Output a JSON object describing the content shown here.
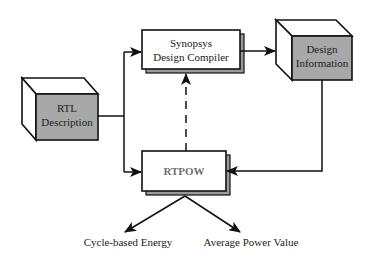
{
  "diagram": {
    "nodes": {
      "rtl": {
        "line1": "RTL",
        "line2": "Description",
        "shape": "3d-box",
        "fill": "#a8a8a8"
      },
      "compiler": {
        "line1": "Synopsys",
        "line2": "Design Compiler",
        "shape": "stacked-rect",
        "fill": "#ffffff"
      },
      "design_info": {
        "line1": "Design",
        "line2": "Information",
        "shape": "3d-box",
        "fill": "#a8a8a8"
      },
      "rtpow": {
        "label": "RTPOW",
        "shape": "stacked-rect",
        "fill": "#ffffff",
        "text_color": "#707070"
      }
    },
    "outputs": {
      "energy": "Cycle-based Energy",
      "power": "Average Power Value"
    },
    "edges": [
      {
        "from": "rtl",
        "to": "compiler",
        "style": "solid"
      },
      {
        "from": "rtl",
        "to": "rtpow",
        "style": "solid"
      },
      {
        "from": "compiler",
        "to": "design_info",
        "style": "solid"
      },
      {
        "from": "design_info",
        "to": "rtpow",
        "style": "solid"
      },
      {
        "from": "rtpow",
        "to": "compiler",
        "style": "dashed"
      },
      {
        "from": "rtpow",
        "to": "energy",
        "style": "solid"
      },
      {
        "from": "rtpow",
        "to": "power",
        "style": "solid"
      }
    ],
    "colors": {
      "line": "#1a1a1a",
      "box_gray": "#a8a8a8",
      "shadow_gray": "#9a9a9a"
    }
  }
}
